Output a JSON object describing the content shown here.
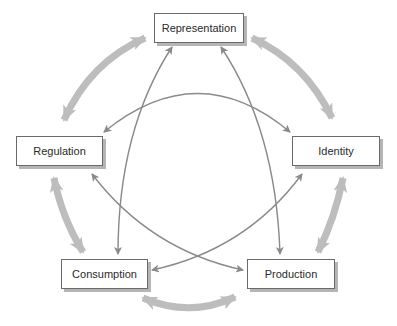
{
  "diagram": {
    "nodes": [
      {
        "id": "representation",
        "label": "Representation"
      },
      {
        "id": "identity",
        "label": "Identity"
      },
      {
        "id": "production",
        "label": "Production"
      },
      {
        "id": "consumption",
        "label": "Consumption"
      },
      {
        "id": "regulation",
        "label": "Regulation"
      }
    ],
    "outer_cycle": [
      [
        "representation",
        "identity"
      ],
      [
        "identity",
        "production"
      ],
      [
        "production",
        "consumption"
      ],
      [
        "consumption",
        "regulation"
      ],
      [
        "regulation",
        "representation"
      ]
    ],
    "inner_links": [
      [
        "representation",
        "consumption"
      ],
      [
        "representation",
        "production"
      ],
      [
        "regulation",
        "identity"
      ],
      [
        "regulation",
        "production"
      ],
      [
        "identity",
        "consumption"
      ]
    ],
    "colors": {
      "outer_arrow": "#bdbdbd",
      "inner_arrow": "#8a8a8a",
      "box_border": "#6a6a6a",
      "box_shadow": "#b5b5b5"
    }
  }
}
